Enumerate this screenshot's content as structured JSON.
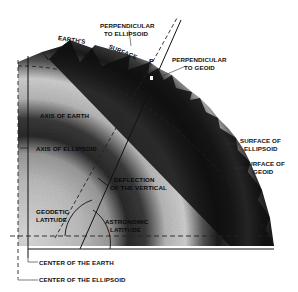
{
  "figure": {
    "type": "geodesy-diagram"
  },
  "labels": {
    "earths_surface_1": "EARTH'S",
    "earths_surface_2": "SURFACE",
    "perp_ellipsoid_1": "PERPENDICULAR",
    "perp_ellipsoid_2": "TO ELLIPSOID",
    "point_p": "P",
    "perp_geoid_1": "PERPENDICULAR",
    "perp_geoid_2": "TO GEOID",
    "axis_of_earth": "AXIS OF EARTH",
    "axis_of_ellipsoid": "AXIS OF ELLIPSOID",
    "deflection_1": "DEFLECTION",
    "deflection_2": "OF THE VERTICAL",
    "surface_ellipsoid_1": "SURFACE OF",
    "surface_ellipsoid_2": "ELLIPSOID",
    "surface_geoid_1": "SURFACE OF",
    "surface_geoid_2": "GEOID",
    "geodetic_1": "GEODETIC",
    "geodetic_2": "LATITUDE",
    "astronomic_1": "ASTRONOMIC",
    "astronomic_2": "LATITUDE",
    "center_earth": "CENTER OF THE EARTH",
    "center_ellipsoid": "CENTER OF THE ELLIPSOID"
  },
  "colors": {
    "background": "#ffffff",
    "ink": "#111111",
    "shade_dark": "#1a1a1a",
    "shade_mid": "#7a7a7a",
    "shade_light": "#d8d8d8"
  }
}
